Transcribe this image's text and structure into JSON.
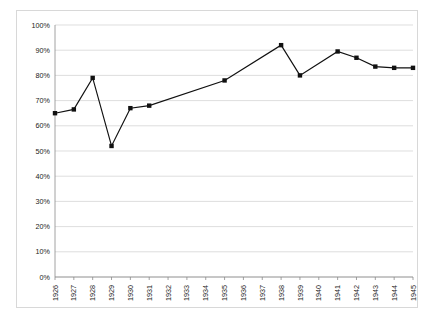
{
  "chart_data": {
    "type": "line",
    "title": "",
    "subtitle": "",
    "xlabel": "",
    "ylabel": "",
    "ylim": [
      0,
      100
    ],
    "y_tick_labels": [
      "0%",
      "10%",
      "20%",
      "30%",
      "40%",
      "50%",
      "60%",
      "70%",
      "80%",
      "90%",
      "100%"
    ],
    "y_ticks": [
      0,
      10,
      20,
      30,
      40,
      50,
      60,
      70,
      80,
      90,
      100
    ],
    "grid": true,
    "grid_axis": "y",
    "legend": false,
    "legend_position": "none",
    "categories": [
      "1926",
      "1927",
      "1928",
      "1929",
      "1930",
      "1931",
      "1932",
      "1933",
      "1934",
      "1935",
      "1936",
      "1937",
      "1938",
      "1939",
      "1940",
      "1941",
      "1942",
      "1943",
      "1944",
      "1945"
    ],
    "x": [
      1926,
      1927,
      1928,
      1929,
      1930,
      1931,
      1932,
      1933,
      1934,
      1935,
      1936,
      1937,
      1938,
      1939,
      1940,
      1941,
      1942,
      1943,
      1944,
      1945
    ],
    "values": [
      65,
      66.5,
      79,
      52,
      67,
      68,
      null,
      null,
      null,
      78,
      null,
      null,
      92,
      80,
      null,
      89.5,
      87,
      83.5,
      83,
      83
    ],
    "marker": "square",
    "marker_color": "#111111",
    "line_color": "#111111",
    "series": [
      {
        "name": "series-1",
        "values": [
          65,
          66.5,
          79,
          52,
          67,
          68,
          null,
          null,
          null,
          78,
          null,
          null,
          92,
          80,
          null,
          89.5,
          87,
          83.5,
          83,
          83
        ]
      }
    ]
  },
  "colors": {
    "line": "#111111",
    "marker": "#111111",
    "gridline": "#d0d0d0",
    "axis": "#8a8a8a",
    "border": "#d8d8d8",
    "plot_background": "#ffffff",
    "text": "#1a1a1a"
  }
}
